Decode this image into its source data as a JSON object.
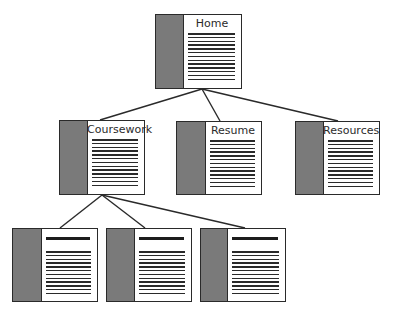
{
  "diagram": {
    "type": "site-map-tree",
    "colors": {
      "border": "#2a2a2a",
      "sidebar": "#7a7a7a",
      "page": "#ffffff",
      "text": "#2b2b2b",
      "connector": "#2a2a2a"
    },
    "nodes": [
      {
        "id": "home",
        "label": "Home",
        "x": 155,
        "y": 14,
        "w": 87,
        "h": 75,
        "side_w": 27,
        "style": "titled",
        "line_count": 14
      },
      {
        "id": "coursework",
        "label": "Coursework",
        "x": 59,
        "y": 120,
        "w": 86,
        "h": 75,
        "side_w": 27,
        "style": "titled",
        "line_count": 14
      },
      {
        "id": "resume",
        "label": "Resume",
        "x": 176,
        "y": 121,
        "w": 86,
        "h": 74,
        "side_w": 28,
        "style": "titled",
        "line_count": 14
      },
      {
        "id": "resources",
        "label": "Resources",
        "x": 295,
        "y": 121,
        "w": 85,
        "h": 74,
        "side_w": 27,
        "style": "titled",
        "line_count": 14
      },
      {
        "id": "course-page-1",
        "label": "",
        "x": 12,
        "y": 228,
        "w": 86,
        "h": 74,
        "side_w": 28,
        "style": "headbar",
        "line_count": 14
      },
      {
        "id": "course-page-2",
        "label": "",
        "x": 106,
        "y": 228,
        "w": 86,
        "h": 74,
        "side_w": 27,
        "style": "headbar",
        "line_count": 14
      },
      {
        "id": "course-page-3",
        "label": "",
        "x": 200,
        "y": 228,
        "w": 86,
        "h": 74,
        "side_w": 26,
        "style": "headbar",
        "line_count": 14
      }
    ],
    "edges": [
      {
        "from": "home",
        "to": "coursework",
        "x1": 202,
        "y1": 89,
        "x2": 100,
        "y2": 120
      },
      {
        "from": "home",
        "to": "resume",
        "x1": 202,
        "y1": 89,
        "x2": 220,
        "y2": 121
      },
      {
        "from": "home",
        "to": "resources",
        "x1": 202,
        "y1": 89,
        "x2": 338,
        "y2": 121
      },
      {
        "from": "coursework",
        "to": "course-page-1",
        "x1": 102,
        "y1": 195,
        "x2": 60,
        "y2": 228
      },
      {
        "from": "coursework",
        "to": "course-page-2",
        "x1": 102,
        "y1": 195,
        "x2": 145,
        "y2": 228
      },
      {
        "from": "coursework",
        "to": "course-page-3",
        "x1": 102,
        "y1": 195,
        "x2": 245,
        "y2": 228
      }
    ]
  }
}
